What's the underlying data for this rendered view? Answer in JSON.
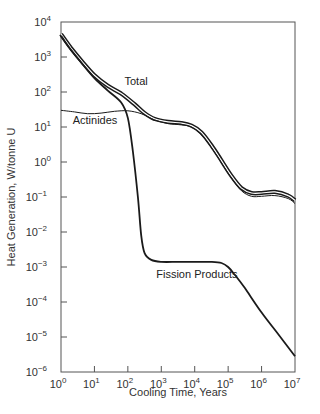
{
  "chart_data": {
    "type": "line",
    "title": "",
    "xlabel": "Cooling Time, Years",
    "ylabel": "Heat Generation, W/tonne U",
    "xscale": "log",
    "yscale": "log",
    "xlim": [
      1,
      10000000
    ],
    "ylim": [
      1e-06,
      10000
    ],
    "grid": false,
    "legend": "none (inline annotations)",
    "x_ticks": [
      {
        "base": "10",
        "exp": "0"
      },
      {
        "base": "10",
        "exp": "1"
      },
      {
        "base": "10",
        "exp": "2"
      },
      {
        "base": "10",
        "exp": "3"
      },
      {
        "base": "10",
        "exp": "4"
      },
      {
        "base": "10",
        "exp": "5"
      },
      {
        "base": "10",
        "exp": "6"
      },
      {
        "base": "10",
        "exp": "7"
      }
    ],
    "y_ticks": [
      {
        "base": "10",
        "exp": "4"
      },
      {
        "base": "10",
        "exp": "3"
      },
      {
        "base": "10",
        "exp": "2"
      },
      {
        "base": "10",
        "exp": "1"
      },
      {
        "base": "10",
        "exp": "0"
      },
      {
        "base": "10",
        "exp": "−1"
      },
      {
        "base": "10",
        "exp": "−2"
      },
      {
        "base": "10",
        "exp": "−3"
      },
      {
        "base": "10",
        "exp": "−4"
      },
      {
        "base": "10",
        "exp": "−5"
      },
      {
        "base": "10",
        "exp": "−6"
      }
    ],
    "series": [
      {
        "name": "Total",
        "style": "double-line-bold",
        "log10_x": [
          0,
          0.3,
          0.6,
          1.0,
          1.4,
          1.8,
          2.2,
          2.5,
          2.8,
          3.2,
          3.6,
          3.9,
          4.2,
          4.5,
          4.8,
          5.1,
          5.4,
          5.7,
          6.0,
          6.4,
          6.8,
          7.0
        ],
        "values": [
          4500,
          1800,
          800,
          300,
          150,
          90,
          45,
          25,
          17,
          14,
          13,
          11,
          7,
          3,
          1.1,
          0.4,
          0.18,
          0.13,
          0.13,
          0.14,
          0.11,
          0.08
        ]
      },
      {
        "name": "Actinides",
        "style": "double-line-thin",
        "log10_x": [
          0,
          0.4,
          0.8,
          1.2,
          1.6,
          2.0,
          2.4,
          2.8,
          3.2,
          3.6,
          3.9,
          4.2,
          4.5,
          4.8,
          5.1,
          5.4,
          5.7,
          6.0,
          6.4,
          6.8,
          7.0
        ],
        "values": [
          30,
          27,
          24,
          25,
          28,
          29,
          24,
          16,
          12.5,
          11.5,
          10,
          6,
          2.6,
          0.95,
          0.35,
          0.15,
          0.105,
          0.105,
          0.11,
          0.09,
          0.065
        ]
      },
      {
        "name": "Fission Products",
        "style": "single-line-bold",
        "log10_x": [
          0,
          0.3,
          0.6,
          1.0,
          1.4,
          1.8,
          2.0,
          2.15,
          2.3,
          2.4,
          2.5,
          2.7,
          3.0,
          3.5,
          4.0,
          4.5,
          4.8,
          5.0,
          5.2,
          5.5,
          6.0,
          6.5,
          7.0
        ],
        "values": [
          4000,
          1600,
          700,
          250,
          110,
          50,
          18,
          2,
          0.1,
          0.008,
          0.0025,
          0.0016,
          0.0014,
          0.0014,
          0.0014,
          0.0014,
          0.0013,
          0.001,
          0.0006,
          0.00025,
          5e-05,
          1.2e-05,
          2.8e-06
        ]
      }
    ],
    "annotations": [
      {
        "text": "Total",
        "x_log": 1.9,
        "y_log": 2.2
      },
      {
        "text": "Actinides",
        "x_log": 0.35,
        "y_log": 1.08
      },
      {
        "text": "Fission Products",
        "x_log": 2.85,
        "y_log": -3.3
      }
    ]
  },
  "labels": {
    "xlabel": "Cooling Time, Years",
    "ylabel": "Heat Generation, W/tonne U",
    "total": "Total",
    "actinides": "Actinides",
    "fission": "Fission Products"
  },
  "colors": {
    "line": "#1a1a1a",
    "axis": "#555555",
    "background": "#ffffff"
  }
}
